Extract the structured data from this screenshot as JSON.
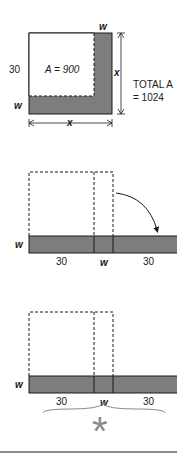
{
  "figure1": {
    "label_w_top": "w",
    "label_30": "30",
    "label_area": "A = 900",
    "label_w_left": "w",
    "label_x_right": "x",
    "label_x_bottom": "x",
    "total_line1": "TOTAL A",
    "total_line2": "= 1024"
  },
  "figure2": {
    "label_w_left": "w",
    "label_30_left": "30",
    "label_w_mid": "w",
    "label_30_right": "30"
  },
  "figure3": {
    "label_w_left": "w",
    "label_30_left": "30",
    "label_w_mid": "w",
    "label_30_right": "30",
    "asterisk": "*"
  },
  "colors": {
    "shade": "#7d7d7d",
    "line": "#1a1a1a",
    "asterisk": "#8a8a8a"
  }
}
